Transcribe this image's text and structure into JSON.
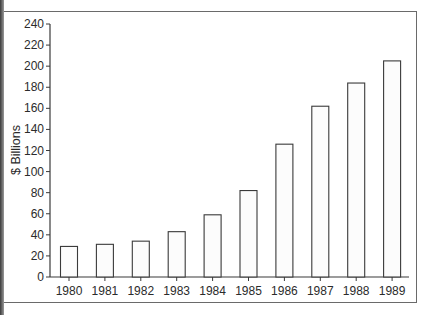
{
  "chart_data": {
    "type": "bar",
    "title": "",
    "xlabel": "",
    "ylabel": "$ Billions",
    "categories": [
      "1980",
      "1981",
      "1982",
      "1983",
      "1984",
      "1985",
      "1986",
      "1987",
      "1988",
      "1989"
    ],
    "values": [
      29,
      31,
      34,
      43,
      59,
      82,
      126,
      162,
      184,
      205
    ],
    "ylim": [
      0,
      240
    ],
    "yticks": [
      0,
      20,
      40,
      60,
      80,
      100,
      120,
      140,
      160,
      180,
      200,
      220,
      240
    ],
    "grid": false,
    "legend": null,
    "bar_fill": "#fcfcfc",
    "bar_stroke": "#3a3a3a"
  }
}
